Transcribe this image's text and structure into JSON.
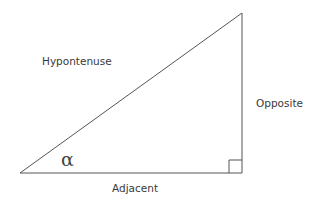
{
  "diagram": {
    "type": "right-triangle",
    "labels": {
      "hypotenuse": "Hypontenuse",
      "opposite": "Opposite",
      "adjacent": "Adjacent",
      "angle": "α"
    },
    "colors": {
      "stroke": "#555555",
      "text": "#3a3a3a",
      "background": "#ffffff"
    },
    "vertices": {
      "angle_vertex": [
        20,
        173
      ],
      "top_vertex": [
        242,
        13
      ],
      "right_angle_vertex": [
        242,
        173
      ]
    },
    "right_angle_marker_size": 13
  }
}
